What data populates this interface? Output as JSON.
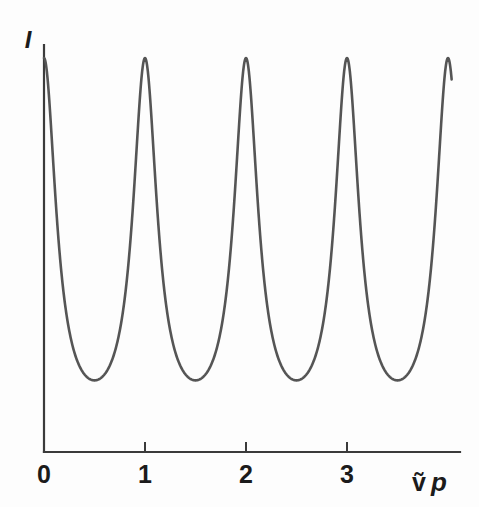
{
  "chart_data": {
    "type": "line",
    "title": "",
    "subtitle": "",
    "xlabel": "ṽp",
    "xlabel_parts": {
      "nu_tilde": "ṽ",
      "p": "p"
    },
    "ylabel": "I",
    "xlim": [
      0,
      4.1
    ],
    "ylim": [
      0,
      1.0
    ],
    "grid": false,
    "legend": null,
    "xticks": [
      0,
      1,
      2,
      3
    ],
    "xticklabels": [
      "0",
      "1",
      "2",
      "3"
    ],
    "yticks": [],
    "yticklabels": [],
    "function": "Airy / Fabry-Perot transmission: I = 1 / (1 + F*sin^2(pi*x)), F = 4.5",
    "curve_color": "#555555",
    "axis_color": "#3b3b3b",
    "background_color": "#fdfdfd",
    "series": [
      {
        "name": "Transmitted intensity",
        "x": [
          0.0,
          0.05,
          0.1,
          0.15,
          0.2,
          0.25,
          0.3,
          0.35,
          0.4,
          0.45,
          0.5,
          0.55,
          0.6,
          0.65,
          0.7,
          0.75,
          0.8,
          0.85,
          0.9,
          0.95,
          1.0,
          1.05,
          1.1,
          1.15,
          1.2,
          1.25,
          1.3,
          1.35,
          1.4,
          1.45,
          1.5,
          1.55,
          1.6,
          1.65,
          1.7,
          1.75,
          1.8,
          1.85,
          1.9,
          1.95,
          2.0,
          2.05,
          2.1,
          2.15,
          2.2,
          2.25,
          2.3,
          2.35,
          2.4,
          2.45,
          2.5,
          2.55,
          2.6,
          2.65,
          2.7,
          2.75,
          2.8,
          2.85,
          2.9,
          2.95,
          3.0,
          3.05,
          3.1,
          3.15,
          3.2,
          3.25,
          3.3,
          3.35,
          3.4,
          3.45,
          3.5,
          3.55,
          3.6,
          3.65,
          3.7,
          3.75,
          3.8,
          3.85,
          3.9,
          3.95,
          4.0,
          4.05,
          4.1
        ],
        "y": [
          1.0,
          0.9,
          0.702,
          0.508,
          0.365,
          0.267,
          0.202,
          0.16,
          0.134,
          0.12,
          0.182,
          0.12,
          0.134,
          0.16,
          0.202,
          0.267,
          0.365,
          0.508,
          0.702,
          0.9,
          1.0,
          0.9,
          0.702,
          0.508,
          0.365,
          0.267,
          0.202,
          0.16,
          0.134,
          0.12,
          0.182,
          0.12,
          0.134,
          0.16,
          0.202,
          0.267,
          0.365,
          0.508,
          0.702,
          0.9,
          1.0,
          0.9,
          0.702,
          0.508,
          0.365,
          0.267,
          0.202,
          0.16,
          0.134,
          0.12,
          0.182,
          0.12,
          0.134,
          0.16,
          0.202,
          0.267,
          0.365,
          0.508,
          0.702,
          0.9,
          1.0,
          0.9,
          0.702,
          0.508,
          0.365,
          0.267,
          0.202,
          0.16,
          0.134,
          0.12,
          0.182,
          0.12,
          0.134,
          0.16,
          0.202,
          0.267,
          0.365,
          0.508,
          0.702,
          0.9,
          1.0,
          1.0,
          1.0
        ]
      }
    ],
    "peaks": {
      "x": [
        0,
        1,
        2,
        3,
        4
      ],
      "y": [
        1.0,
        1.0,
        1.0,
        1.0,
        1.0
      ]
    },
    "troughs": {
      "x": [
        0.5,
        1.5,
        2.5,
        3.5
      ],
      "y": [
        0.0,
        0.0,
        0.0,
        0.0
      ]
    }
  },
  "geometry": {
    "x_axis_y": 452,
    "y_axis_x": 44,
    "y_axis_top": 45,
    "x_axis_right": 460,
    "px_per_unit": 101,
    "peak_top_y": 58,
    "tick_length": 10,
    "tick_label_y": 483,
    "curve_clip_x": 452
  }
}
